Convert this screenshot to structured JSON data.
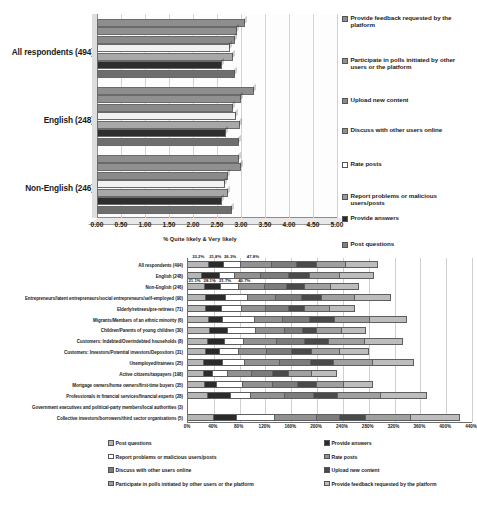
{
  "chart_data": [
    {
      "type": "bar",
      "title": "",
      "orientation": "horizontal",
      "xlabel": "% Quite likely & Very likely",
      "ylabel": "",
      "xlim": [
        0,
        5
      ],
      "xticks": [
        "0.00",
        "0.50",
        "1.00",
        "1.50",
        "2.00",
        "2.50",
        "3.00",
        "3.50",
        "4.00",
        "4.50",
        "5.00"
      ],
      "grid": true,
      "legend_position": "right",
      "categories": [
        "All respondents (494)",
        "English (248)",
        "Non-English (246)"
      ],
      "series": [
        {
          "name": "Provide feedback requested by the platform",
          "color": "#8e8e8e",
          "values": [
            3.05,
            3.22,
            2.92
          ]
        },
        {
          "name": "Participate in polls initiated by other users or the platform",
          "color": "#909090",
          "values": [
            2.88,
            2.96,
            2.95
          ]
        },
        {
          "name": "Upload new content",
          "color": "#8a8a8a",
          "values": [
            2.84,
            2.8,
            2.69
          ]
        },
        {
          "name": "Discuss with other users online",
          "color": "#f2f2f2",
          "values": [
            2.73,
            2.85,
            2.62
          ]
        },
        {
          "name": "Rate posts",
          "color": "#a8a8a8",
          "values": [
            2.8,
            2.93,
            2.69
          ]
        },
        {
          "name": "Report problems or malicious users/posts",
          "color": "#2e2e2e",
          "values": [
            2.56,
            2.65,
            2.56
          ]
        },
        {
          "name": "Provide answers",
          "color": "#6e6e6e",
          "values": [
            2.83,
            2.92,
            2.77
          ]
        }
      ],
      "legend_entries": [
        "Provide feedback requested by the platform",
        "Participate in polls initiated by other users or the platform",
        "Upload new content",
        "Discuss with other users online",
        "Rate posts",
        "Report problems or malicious users/posts",
        "Provide answers",
        "Post questions"
      ]
    },
    {
      "type": "bar",
      "subtype": "stacked",
      "orientation": "horizontal",
      "title": "",
      "xlabel": "",
      "ylabel": "",
      "xlim": [
        0,
        460
      ],
      "xticks": [
        "0%",
        "40%",
        "80%",
        "120%",
        "160%",
        "200%",
        "240%",
        "280%",
        "320%",
        "360%",
        "400%",
        "440%"
      ],
      "grid": true,
      "legend_position": "bottom",
      "data_labels_top": [
        "33.2%",
        "21.8%",
        "26.3%",
        "47.8%"
      ],
      "data_labels_second": [
        "21.1%",
        "28.1%",
        "21.7%",
        "40.7%"
      ],
      "categories": [
        "All respondents (494)",
        "English (248)",
        "Non-English (246)",
        "Entrepreneurs/latent entrepreneurs/social entrepreneurs/self-employed (90)",
        "Elderly/retirees/pre-retirees (71)",
        "Migrants/Members of an ethnic minority (6)",
        "Children/Parents of young children (30)",
        "Customers: Indebted/Overindebted households (8)",
        "Customers: Investors/Potential investors/Depositors (31)",
        "Unemployed/trainees (25)",
        "Active citizens/taxpayers (198)",
        "Mortgage owners/home owners/first-time buyers (35)",
        "Professionals in financial services/financial experts (28)",
        "Government executives and political-party members/local authorities (3)",
        "Collective investors/borrowers/third sector organisations (5)"
      ],
      "series": [
        {
          "name": "Post questions",
          "color": "#b6b6b6",
          "values": [
            33.2,
            21.1,
            26.0,
            28.0,
            28.0,
            32.0,
            34.0,
            30.0,
            27.0,
            25.0,
            24.0,
            26.0,
            30.0,
            0,
            40.0
          ]
        },
        {
          "name": "Provide answers",
          "color": "#2b2b2b",
          "values": [
            21.8,
            28.1,
            24.0,
            30.0,
            24.0,
            22.0,
            28.0,
            26.0,
            22.0,
            28.0,
            14.0,
            18.0,
            36.0,
            0,
            36.0
          ]
        },
        {
          "name": "Report problems or malicious users/posts",
          "color": "#ffffff",
          "values": [
            26.3,
            21.7,
            28.0,
            34.0,
            30.0,
            50.0,
            44.0,
            30.0,
            28.0,
            34.0,
            22.0,
            40.0,
            32.0,
            0,
            60.0
          ]
        },
        {
          "name": "Rate posts",
          "color": "#919191",
          "values": [
            47.8,
            40.7,
            40.0,
            44.0,
            38.0,
            44.0,
            44.0,
            52.0,
            44.0,
            56.0,
            38.0,
            48.0,
            52.0,
            0,
            66.0
          ]
        },
        {
          "name": "Discuss with other users online",
          "color": "#7c7c7c",
          "values": [
            40.0,
            44.0,
            34.0,
            40.0,
            36.0,
            42.0,
            28.0,
            44.0,
            40.0,
            48.0,
            32.0,
            38.0,
            46.0,
            0,
            36.0
          ]
        },
        {
          "name": "Upload new content",
          "color": "#4a4a4a",
          "values": [
            30.0,
            32.0,
            28.0,
            32.0,
            24.0,
            38.0,
            22.0,
            36.0,
            30.0,
            36.0,
            24.0,
            30.0,
            38.0,
            0,
            40.0
          ]
        },
        {
          "name": "Participate in polls initiated by other users or the platform",
          "color": "#a0a0a0",
          "values": [
            46.0,
            48.0,
            40.0,
            52.0,
            38.0,
            56.0,
            38.0,
            58.0,
            44.0,
            62.0,
            36.0,
            42.0,
            68.0,
            0,
            72.0
          ]
        },
        {
          "name": "Provide feedback requested by the platform",
          "color": "#bdbdbd",
          "values": [
            50.0,
            52.0,
            44.0,
            56.0,
            40.0,
            58.0,
            38.0,
            60.0,
            46.0,
            64.0,
            38.0,
            44.0,
            72.0,
            0,
            78.0
          ]
        }
      ],
      "legend_entries_left": [
        "Post questions",
        "Report problems or malicious users/posts",
        "Discuss with other users online",
        "Participate in polls initiated by other users or the platform"
      ],
      "legend_entries_right": [
        "Provide answers",
        "Rate posts",
        "Upload new content",
        "Provide feedback requested by the platform"
      ]
    }
  ]
}
